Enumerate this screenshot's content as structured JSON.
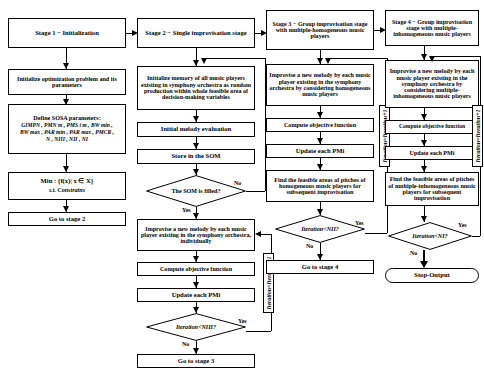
{
  "diagram": {
    "labels": {
      "yes": "Yes",
      "no": "No"
    },
    "iteration_increment": "Iteration=Iteration+1"
  },
  "col1": {
    "stage_header": "Stage 1 − Initialization",
    "init_problem": "Initialize optimization problem and its parameters",
    "define_params_title": "Define SOSA parameters:",
    "params_line1": "GIMPN , PMN m , PMS i m , BW min ,",
    "params_line2": "BW max , PAR min , PAR max , PMCR ,",
    "params_line3": "N , NIII , NII , NI",
    "objective": "Min : {f(x)| x ∈ X}",
    "subject_to": "s.t. Constrains",
    "goto": "Go to stage 2"
  },
  "col2": {
    "stage_header": "Stage 2 − Single improvisation stage",
    "init_memory": "Initialize memory of all music players existing in symphony orchestra as random production within whole feasible area of decision-making variables",
    "initial_melody": "Initial melody evaluation",
    "store_som": "Store in the SOM",
    "som_filled": "The SOM is filled?",
    "improvise": "Improvise a new melody by each music player existing in the symphony orchestra, individually",
    "compute": "Compute objective function",
    "update": "Update each PMi",
    "iteration_check": "Iteration<NIII?",
    "goto": "Go to stage 3"
  },
  "col3": {
    "stage_header": "Stage 3 − Group improvisation stage with multiple-homogeneous music players",
    "improvise": "Improvise a new melody by each music player existing in the symphony orchestra by considering homogeneous music players",
    "compute": "Compute objective function",
    "update": "Update each PMi",
    "find_feasible": "Find the feasible areas of pitches of homogeneous music players for subsequent improvisation",
    "iteration_check": "Iteration<NII?",
    "goto": "Go to stage 4"
  },
  "col4": {
    "stage_header": "Stage 4 − Group improvisation stage with multiple-inhomogeneous music players",
    "improvise": "Improvise a new melody by each music player existing in the symphony orchestra by considering multiple-inhomogeneous music players",
    "compute": "Compute objective function",
    "update": "Update each PMi",
    "find_feasible": "Find the feasible areas of pitches of multiple-inhomogeneous music players for subsequent improvisation",
    "iteration_check": "Iteration<NI?",
    "stop": "Stop-Output"
  }
}
